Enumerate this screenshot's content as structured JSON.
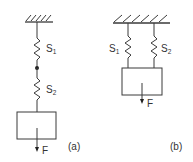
{
  "figure": {
    "type": "spring-mass-system",
    "colors": {
      "stroke": "#3a3a3a",
      "background": "#ffffff"
    },
    "panels": [
      {
        "id": "a",
        "caption": "(a)",
        "arrangement": "series",
        "springs": [
          {
            "label": "S",
            "subscript": "1"
          },
          {
            "label": "S",
            "subscript": "2"
          }
        ],
        "force_label": "F",
        "junction": "dot"
      },
      {
        "id": "b",
        "caption": "(b)",
        "arrangement": "parallel",
        "springs": [
          {
            "label": "S",
            "subscript": "1"
          },
          {
            "label": "S",
            "subscript": "2"
          }
        ],
        "force_label": "F"
      }
    ]
  }
}
